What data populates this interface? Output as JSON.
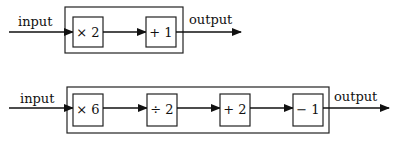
{
  "diagrams": [
    {
      "input_label": "input",
      "output_label": "output",
      "operations": [
        "× 2",
        "+ 1"
      ]
    },
    {
      "input_label": "input",
      "output_label": "output",
      "operations": [
        "× 6",
        "÷ 2",
        "+ 2",
        "− 1"
      ]
    }
  ],
  "colors": {
    "stroke": "#111111",
    "background": "#ffffff"
  }
}
